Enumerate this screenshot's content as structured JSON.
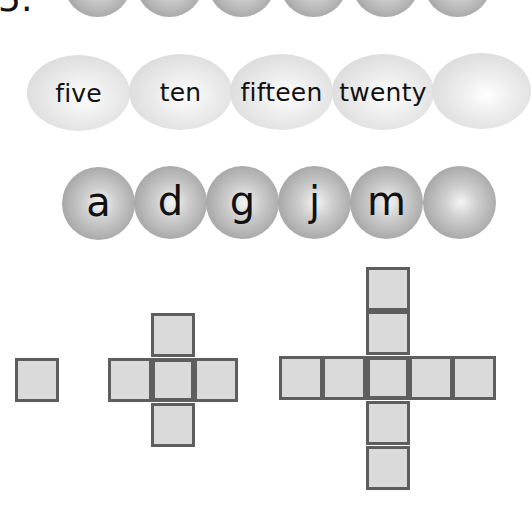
{
  "worksheet": {
    "item_label": "5.",
    "rows": [
      {
        "name": "number-sequence",
        "type": "digits",
        "items": [
          "1",
          "2",
          "3",
          "4",
          "5",
          ""
        ]
      },
      {
        "name": "word-sequence",
        "type": "number-words",
        "items": [
          "five",
          "ten",
          "fifteen",
          "twenty",
          ""
        ]
      },
      {
        "name": "letter-sequence",
        "type": "letters",
        "items": [
          "a",
          "d",
          "g",
          "j",
          "m",
          ""
        ]
      }
    ],
    "shape_pattern": {
      "name": "growing-cross",
      "figures": [
        {
          "squares": 1,
          "arm_length": 0
        },
        {
          "squares": 5,
          "arm_length": 1
        },
        {
          "squares": 9,
          "arm_length": 2
        }
      ]
    }
  },
  "colors": {
    "square_fill": "#dadada",
    "square_border": "#5e5e5e",
    "ball_dark": "#a9a9a9",
    "ball_light": "#e0e0e0",
    "text": "#111111"
  }
}
